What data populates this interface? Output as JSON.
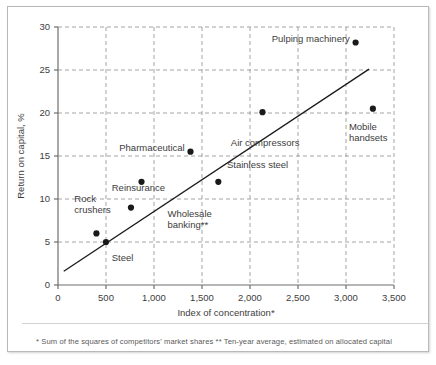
{
  "chart_data": {
    "type": "scatter",
    "title": "",
    "xlabel": "Index of concentration*",
    "ylabel": "Return on capital, %",
    "xlim": [
      0,
      3500
    ],
    "ylim": [
      0,
      30
    ],
    "xticks": [
      0,
      500,
      1000,
      1500,
      2000,
      2500,
      3000,
      3500
    ],
    "xtick_labels": [
      "0",
      "500",
      "1,000",
      "1,500",
      "2,000",
      "2,500",
      "3,000",
      "3,500"
    ],
    "yticks": [
      0,
      5,
      10,
      15,
      20,
      25,
      30
    ],
    "ytick_labels": [
      "0",
      "5",
      "10",
      "15",
      "20",
      "25",
      "30"
    ],
    "grid": "dashed",
    "legend": "none",
    "points": [
      {
        "label": "Rock crushers",
        "x": 400,
        "y": 6.0,
        "label_x": 170,
        "label_y": 9.6,
        "label_anchor": "start",
        "label_lines": [
          "Rock",
          "crushers"
        ]
      },
      {
        "label": "Steel",
        "x": 500,
        "y": 5.0,
        "label_x": 560,
        "label_y": 2.8,
        "label_anchor": "start",
        "label_lines": [
          "Steel"
        ]
      },
      {
        "label": "Reinsurance",
        "x": 760,
        "y": 9.0,
        "label_x": 560,
        "label_y": 10.9,
        "label_anchor": "start",
        "label_lines": [
          "Reinsurance"
        ]
      },
      {
        "label": "Wholesale banking",
        "x": 870,
        "y": 12.0,
        "label_x": 1140,
        "label_y": 7.9,
        "label_anchor": "start",
        "label_lines": [
          "Wholesale",
          "banking**"
        ]
      },
      {
        "label": "Pharmaceutical",
        "x": 1380,
        "y": 15.5,
        "label_x": 1320,
        "label_y": 15.6,
        "label_anchor": "end",
        "label_lines": [
          "Pharmaceutical"
        ]
      },
      {
        "label": "Stainless steel",
        "x": 1670,
        "y": 12.0,
        "label_x": 1760,
        "label_y": 13.6,
        "label_anchor": "start",
        "label_lines": [
          "Stainless steel"
        ]
      },
      {
        "label": "Air compressors",
        "x": 2130,
        "y": 20.1,
        "label_x": 1800,
        "label_y": 16.2,
        "label_anchor": "start",
        "label_lines": [
          "Air compressors"
        ]
      },
      {
        "label": "Pulping machinery",
        "x": 3100,
        "y": 28.2,
        "label_x": 3040,
        "label_y": 28.2,
        "label_anchor": "end",
        "label_lines": [
          "Pulping machinery"
        ]
      },
      {
        "label": "Mobile handsets",
        "x": 3280,
        "y": 20.5,
        "label_x": 3030,
        "label_y": 18.0,
        "label_anchor": "start",
        "label_lines": [
          "Mobile",
          "handsets"
        ]
      }
    ],
    "trendline": {
      "x0": 60,
      "y0": 1.6,
      "x1": 3240,
      "y1": 25.1
    }
  },
  "footnote": {
    "text": "* Sum of the squares of competitors' market shares ** Ten-year average, estimated on allocated capital"
  },
  "colors": {
    "point": "#1a1a1a",
    "grid": "#9a9a9a",
    "axis": "#6e6e6e",
    "text": "#3d3d3d",
    "footnote": "#5a5a5a",
    "border": "#b9b9b9",
    "background": "#ffffff"
  }
}
